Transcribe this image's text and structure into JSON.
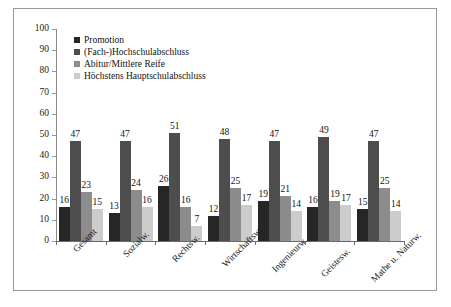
{
  "chart_data": {
    "type": "bar",
    "title": "",
    "subtitle": "",
    "xlabel": "",
    "ylabel": "",
    "ylim": [
      0,
      100
    ],
    "yticks": [
      0,
      10,
      20,
      30,
      40,
      50,
      60,
      70,
      80,
      90,
      100
    ],
    "grid": false,
    "legend_position": "top-left",
    "categories": [
      "Gesamt",
      "Sozialw.",
      "Rechtsw.",
      "Wirtschaftsw.",
      "Ingenieurw.",
      "Geistesw.",
      "Mathe u. Naturw."
    ],
    "series": [
      {
        "name": "Promotion",
        "color": "#262626",
        "values": [
          16,
          13,
          26,
          12,
          19,
          16,
          15
        ]
      },
      {
        "name": "(Fach-)Hochschulabschluss",
        "color": "#4d4d4d",
        "values": [
          47,
          47,
          51,
          48,
          47,
          49,
          47
        ]
      },
      {
        "name": "Abitur/Mittlere Reife",
        "color": "#8c8c8c",
        "values": [
          23,
          24,
          16,
          25,
          21,
          19,
          25
        ]
      },
      {
        "name": "Höchstens Hauptschulabschluss",
        "color": "#cccccc",
        "values": [
          15,
          16,
          7,
          17,
          14,
          17,
          14
        ]
      }
    ]
  },
  "legend": {
    "items": [
      {
        "label": "Promotion",
        "color": "#262626"
      },
      {
        "label": "(Fach-)Hochschulabschluss",
        "color": "#4d4d4d"
      },
      {
        "label": "Abitur/Mittlere Reife",
        "color": "#8c8c8c"
      },
      {
        "label": "Höchstens Hauptschulabschluss",
        "color": "#cccccc"
      }
    ]
  },
  "axes": {
    "y_tick_labels": [
      "100",
      "90",
      "80",
      "70",
      "60",
      "50",
      "40",
      "30",
      "20",
      "10",
      "0"
    ]
  },
  "colors": {
    "frame": "#9a9a9a",
    "axis": "#6b6b6b",
    "text": "#1a1a1a",
    "background": "#ffffff"
  }
}
